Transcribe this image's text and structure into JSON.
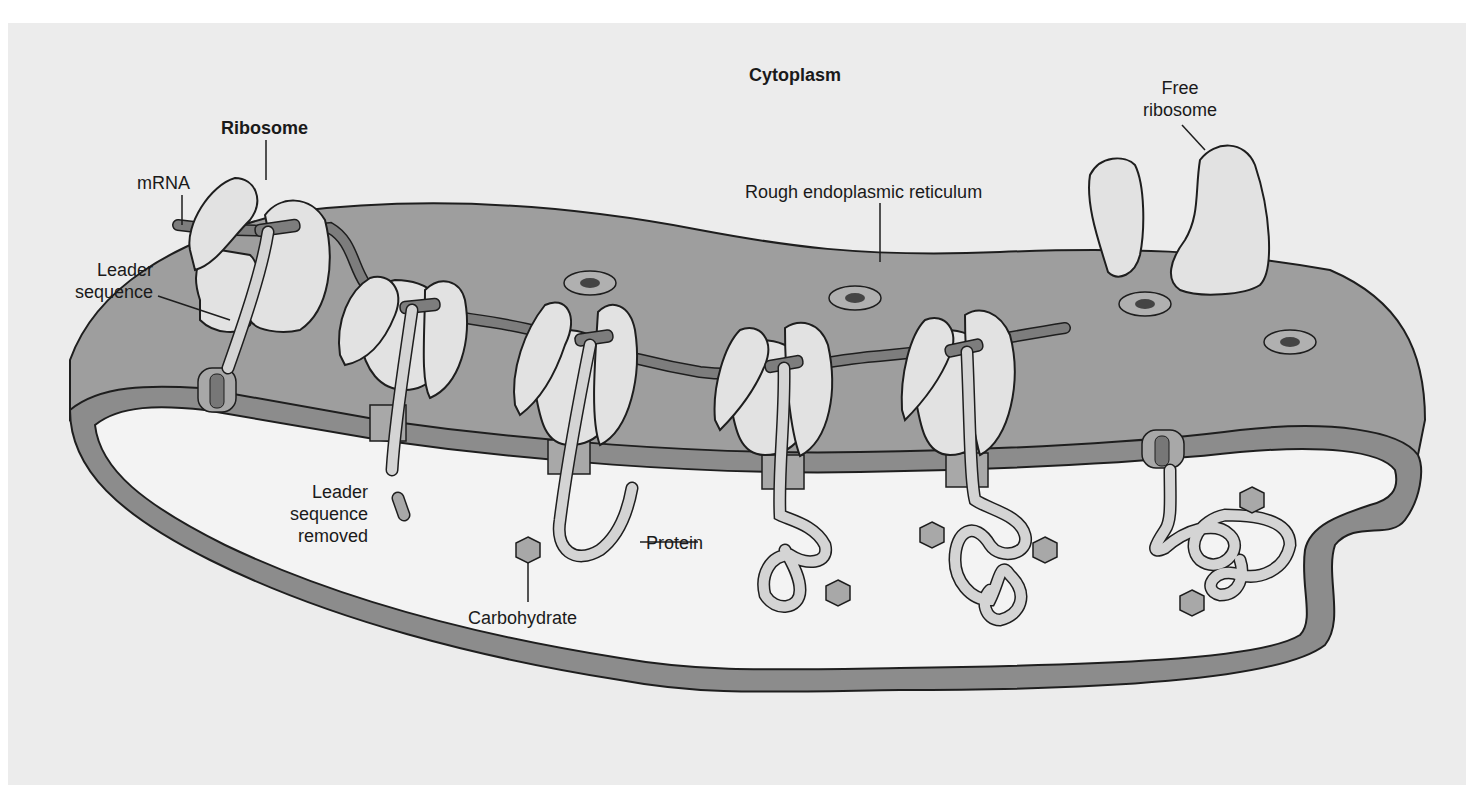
{
  "colors": {
    "background": "#ececec",
    "er_lumen_surface": "#9e9e9e",
    "er_membrane": "#8c8c8c",
    "er_lumen_interior": "#f3f3f3",
    "ribosome": "#e2e2e2",
    "mrna": "#7d7d7d",
    "protein": "#d4d4d4",
    "carbohydrate": "#a8a8a8",
    "outline": "#1e1e1e"
  },
  "labels": {
    "cytoplasm": "Cytoplasm",
    "ribosome": "Ribosome",
    "mrna": "mRNA",
    "leader_sequence": [
      "Leader",
      "sequence"
    ],
    "free_ribosome": [
      "Free",
      "ribosome"
    ],
    "rough_er": "Rough endoplasmic reticulum",
    "leader_sequence_removed": [
      "Leader",
      "sequence",
      "removed"
    ],
    "protein": "Protein",
    "carbohydrate": "Carbohydrate"
  },
  "diagram": {
    "regions": [
      "Cytoplasm",
      "ER lumen"
    ],
    "bound_ribosomes_count": 5,
    "free_ribosomes_count": 1,
    "carbohydrate_groups_count": 7
  }
}
